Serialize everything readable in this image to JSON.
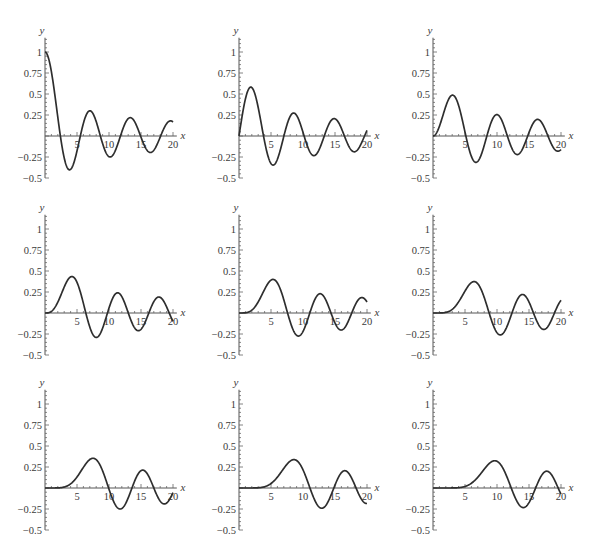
{
  "chart_data": [
    {
      "type": "line",
      "title": "",
      "function": "BesselJ",
      "order": 0,
      "xlabel": "x",
      "ylabel": "y",
      "xlim": [
        0,
        20
      ],
      "ylim": [
        -0.5,
        1.15
      ],
      "xticks": [
        "5",
        "10",
        "15",
        "20"
      ],
      "yticks": [
        "1",
        "0.75",
        "0.5",
        "0.25",
        "-0.25",
        "-0.5"
      ],
      "grid": false,
      "legend": null,
      "series": [
        {
          "name": "J0(x)",
          "x": [
            0,
            2.4,
            3.8,
            5.5,
            7.0,
            8.7,
            10.2,
            11.8,
            13.3,
            14.9,
            16.5,
            18.1,
            20
          ],
          "values": [
            1,
            0,
            -0.4,
            0,
            0.3,
            0,
            -0.25,
            0,
            0.22,
            0,
            -0.19,
            0,
            0.17
          ]
        }
      ]
    },
    {
      "type": "line",
      "title": "",
      "function": "BesselJ",
      "order": 1,
      "xlabel": "x",
      "ylabel": "y",
      "xlim": [
        0,
        20
      ],
      "ylim": [
        -0.5,
        1.15
      ],
      "xticks": [
        "5",
        "10",
        "15",
        "20"
      ],
      "yticks": [
        "1",
        "0.75",
        "0.5",
        "0.25",
        "-0.25",
        "-0.5"
      ],
      "grid": false,
      "legend": null,
      "series": [
        {
          "name": "J1(x)",
          "x": [
            0,
            1.8,
            3.8,
            5.3,
            7.0,
            8.5,
            10.2,
            11.7,
            13.3,
            14.9,
            16.5,
            18.0,
            20
          ],
          "values": [
            0,
            0.58,
            0,
            -0.35,
            0,
            0.27,
            0,
            -0.23,
            0,
            0.2,
            0,
            -0.19,
            0.07
          ]
        }
      ]
    },
    {
      "type": "line",
      "title": "",
      "function": "BesselJ",
      "order": 2,
      "xlabel": "x",
      "ylabel": "y",
      "xlim": [
        0,
        20
      ],
      "ylim": [
        -0.5,
        1.15
      ],
      "xticks": [
        "5",
        "10",
        "15",
        "20"
      ],
      "yticks": [
        "1",
        "0.75",
        "0.5",
        "0.25",
        "-0.25",
        "-0.5"
      ],
      "grid": false,
      "legend": null,
      "series": [
        {
          "name": "J2(x)",
          "x": [
            0,
            3.1,
            5.1,
            6.7,
            8.4,
            9.97,
            11.6,
            13.2,
            14.8,
            16.4,
            17.96,
            20
          ],
          "values": [
            0,
            0.49,
            0,
            -0.31,
            0,
            0.25,
            0,
            -0.22,
            0,
            0.19,
            0,
            -0.16
          ]
        }
      ]
    },
    {
      "type": "line",
      "title": "",
      "function": "BesselJ",
      "order": 3,
      "xlabel": "x",
      "ylabel": "y",
      "xlim": [
        0,
        20
      ],
      "ylim": [
        -0.5,
        1.15
      ],
      "xticks": [
        "5",
        "10",
        "15",
        "20"
      ],
      "yticks": [
        "1",
        "0.75",
        "0.5",
        "0.25",
        "-0.25",
        "-0.5"
      ],
      "grid": false,
      "legend": null,
      "series": [
        {
          "name": "J3(x)",
          "x": [
            0,
            4.2,
            6.4,
            8.0,
            9.8,
            11.3,
            13.0,
            14.6,
            16.2,
            17.8,
            19.4,
            20
          ],
          "values": [
            0,
            0.43,
            0,
            -0.29,
            0,
            0.24,
            0,
            -0.21,
            0,
            0.19,
            0,
            -0.1
          ]
        }
      ]
    },
    {
      "type": "line",
      "title": "",
      "function": "BesselJ",
      "order": 4,
      "xlabel": "x",
      "ylabel": "y",
      "xlim": [
        0,
        20
      ],
      "ylim": [
        -0.5,
        1.15
      ],
      "xticks": [
        "5",
        "10",
        "15",
        "20"
      ],
      "yticks": [
        "1",
        "0.75",
        "0.5",
        "0.25",
        "-0.25",
        "-0.5"
      ],
      "grid": false,
      "legend": null,
      "series": [
        {
          "name": "J4(x)",
          "x": [
            0,
            5.3,
            7.6,
            9.3,
            11.1,
            12.7,
            14.4,
            16.0,
            17.6,
            19.2,
            20
          ],
          "values": [
            0,
            0.4,
            0,
            -0.27,
            0,
            0.23,
            0,
            -0.21,
            0,
            0.18,
            0.13
          ]
        }
      ]
    },
    {
      "type": "line",
      "title": "",
      "function": "BesselJ",
      "order": 5,
      "xlabel": "x",
      "ylabel": "y",
      "xlim": [
        0,
        20
      ],
      "ylim": [
        -0.5,
        1.15
      ],
      "xticks": [
        "5",
        "10",
        "15",
        "20"
      ],
      "yticks": [
        "1",
        "0.75",
        "0.5",
        "0.25",
        "-0.25",
        "-0.5"
      ],
      "grid": false,
      "legend": null,
      "series": [
        {
          "name": "J5(x)",
          "x": [
            0,
            6.4,
            8.8,
            10.5,
            12.3,
            14.0,
            15.7,
            17.3,
            19.0,
            20
          ],
          "values": [
            0,
            0.37,
            0,
            -0.26,
            0,
            0.22,
            0,
            -0.2,
            0,
            0.15
          ]
        }
      ]
    },
    {
      "type": "line",
      "title": "",
      "function": "BesselJ",
      "order": 6,
      "xlabel": "x",
      "ylabel": "y",
      "xlim": [
        0,
        20
      ],
      "ylim": [
        -0.5,
        1.15
      ],
      "xticks": [
        "5",
        "10",
        "15",
        "20"
      ],
      "yticks": [
        "1",
        "0.75",
        "0.5",
        "0.25",
        "-0.25",
        "-0.5"
      ],
      "grid": false,
      "legend": null,
      "series": [
        {
          "name": "J6(x)",
          "x": [
            0,
            7.5,
            9.9,
            11.7,
            13.6,
            15.3,
            17.0,
            18.7,
            20
          ],
          "values": [
            0,
            0.35,
            0,
            -0.25,
            0,
            0.21,
            0,
            -0.2,
            -0.06
          ]
        }
      ]
    },
    {
      "type": "line",
      "title": "",
      "function": "BesselJ",
      "order": 7,
      "xlabel": "x",
      "ylabel": "y",
      "xlim": [
        0,
        20
      ],
      "ylim": [
        -0.5,
        1.15
      ],
      "xticks": [
        "5",
        "10",
        "15",
        "20"
      ],
      "yticks": [
        "1",
        "0.75",
        "0.5",
        "0.25",
        "-0.25",
        "-0.5"
      ],
      "grid": false,
      "legend": null,
      "series": [
        {
          "name": "J7(x)",
          "x": [
            0,
            8.6,
            11.1,
            12.9,
            14.8,
            16.5,
            18.3,
            20
          ],
          "values": [
            0,
            0.33,
            0,
            -0.24,
            0,
            0.21,
            0,
            -0.18
          ]
        }
      ]
    },
    {
      "type": "line",
      "title": "",
      "function": "BesselJ",
      "order": 8,
      "xlabel": "x",
      "ylabel": "y",
      "xlim": [
        0,
        20
      ],
      "ylim": [
        -0.5,
        1.15
      ],
      "xticks": [
        "5",
        "10",
        "15",
        "20"
      ],
      "yticks": [
        "1",
        "0.75",
        "0.5",
        "0.25",
        "-0.25",
        "-0.5"
      ],
      "grid": false,
      "legend": null,
      "series": [
        {
          "name": "J8(x)",
          "x": [
            0,
            9.6,
            12.2,
            14.1,
            16.0,
            17.8,
            19.6,
            20
          ],
          "values": [
            0,
            0.32,
            0,
            -0.23,
            0,
            0.2,
            0,
            -0.07
          ]
        }
      ]
    }
  ],
  "panels": [
    {
      "xlabel": "x",
      "ylabel": "y",
      "yticks": [
        "1",
        "0.75",
        "0.5",
        "0.25",
        "−0.25",
        "−0.5"
      ],
      "xticks": [
        "5",
        "10",
        "15",
        "20"
      ]
    }
  ],
  "layout": {
    "col_axis_x": [
      45,
      239,
      433
    ],
    "row_axis_y": [
      136,
      313,
      488
    ],
    "px_per_x": 6.4,
    "px_per_y": 84
  }
}
